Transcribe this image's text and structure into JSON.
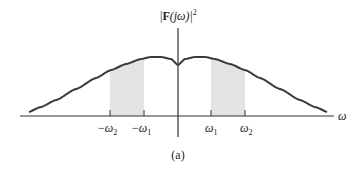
{
  "figure": {
    "ylabel_prefix": "|",
    "ylabel_bold": "F",
    "ylabel_arg": "(jω)|",
    "ylabel_power": "2",
    "xlabel": "ω",
    "caption": "(a)",
    "ticks": [
      {
        "sign": "−",
        "sym": "ω",
        "sub": "2"
      },
      {
        "sign": "−",
        "sym": "ω",
        "sub": "1"
      },
      {
        "sign": "",
        "sym": "ω",
        "sub": "1"
      },
      {
        "sign": "",
        "sym": "ω",
        "sub": "2"
      }
    ],
    "colors": {
      "curve": "#3a3a3a",
      "shade": "#e3e3e3",
      "axis": "#333333"
    }
  },
  "chart_data": {
    "type": "line",
    "xlabel": "ω",
    "ylabel": "|F(jω)|²",
    "caption": "(a)",
    "x_ticks": [
      "−ω2",
      "−ω1",
      "ω1",
      "ω2"
    ],
    "shaded_bands": [
      [
        "−ω2",
        "−ω1"
      ],
      [
        "ω1",
        "ω2"
      ]
    ]
  }
}
